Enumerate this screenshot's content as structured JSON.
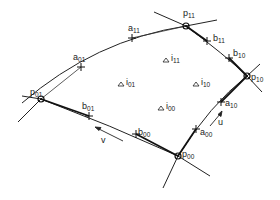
{
  "diagram": {
    "corner_points": [
      {
        "id": "p00",
        "label": "p",
        "sub": "00"
      },
      {
        "id": "p01",
        "label": "p",
        "sub": "01"
      },
      {
        "id": "p10",
        "label": "p",
        "sub": "10"
      },
      {
        "id": "p11",
        "label": "p",
        "sub": "11"
      }
    ],
    "a_points": [
      {
        "id": "a00",
        "label": "a",
        "sub": "00"
      },
      {
        "id": "a01",
        "label": "a",
        "sub": "01"
      },
      {
        "id": "a10",
        "label": "a",
        "sub": "10"
      },
      {
        "id": "a11",
        "label": "a",
        "sub": "11"
      }
    ],
    "b_points": [
      {
        "id": "b00",
        "label": "b",
        "sub": "00"
      },
      {
        "id": "b01",
        "label": "b",
        "sub": "01"
      },
      {
        "id": "b10",
        "label": "b",
        "sub": "10"
      },
      {
        "id": "b11",
        "label": "b",
        "sub": "11"
      }
    ],
    "interior_points": [
      {
        "id": "i00",
        "label": "i",
        "sub": "00"
      },
      {
        "id": "i01",
        "label": "i",
        "sub": "01"
      },
      {
        "id": "i10",
        "label": "i",
        "sub": "10"
      },
      {
        "id": "i11",
        "label": "i",
        "sub": "11"
      }
    ],
    "directions": {
      "u": "u",
      "v": "v"
    }
  }
}
